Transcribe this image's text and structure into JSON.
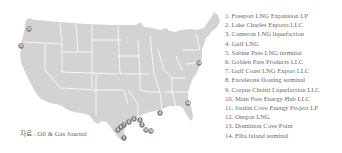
{
  "map": {
    "region": "United States (contiguous)",
    "fill_color": "#d3d3d3",
    "border_color": "#ffffff",
    "marker_color": "#8a8a8a",
    "markers": [
      {
        "id": "1",
        "x": 124,
        "y": 138
      },
      {
        "id": "2",
        "x": 138,
        "y": 120
      },
      {
        "id": "3",
        "x": 141,
        "y": 123
      },
      {
        "id": "4",
        "x": 160,
        "y": 114
      },
      {
        "id": "5",
        "x": 146,
        "y": 117
      },
      {
        "id": "6",
        "x": 133,
        "y": 122
      },
      {
        "id": "7",
        "x": 123,
        "y": 131
      },
      {
        "id": "8",
        "x": 120,
        "y": 132
      },
      {
        "id": "9",
        "x": 120,
        "y": 130
      },
      {
        "id": "10",
        "x": 147,
        "y": 127
      },
      {
        "id": "11",
        "x": 21,
        "y": 47
      },
      {
        "id": "12",
        "x": 29,
        "y": 29
      },
      {
        "id": "13",
        "x": 199,
        "y": 63
      },
      {
        "id": "14",
        "x": 188,
        "y": 103
      }
    ]
  },
  "legend": {
    "items": [
      "1. Freeport LNG Expansion LP",
      "2. Lake Charles Exports LLC",
      "3. Cameron LNG liquefaction",
      "4. Gulf LNG",
      "5. Sabine Pass LNG terminal",
      "6. Golden Pass Products LLC",
      "7. Gulf Coast LNG Export LLC",
      "8. Excelerate floating terminal",
      "9. Corpus Christi Liquefaction LLC",
      "10. Main Pass Energy Hub LLC",
      "11. Jordan Cove Energy Project LP",
      "12. Oregon LNG",
      "13. Dominion Cove Point",
      "14. Elba Island terminal"
    ]
  },
  "source": "자료 : Oil & Gas Journal"
}
